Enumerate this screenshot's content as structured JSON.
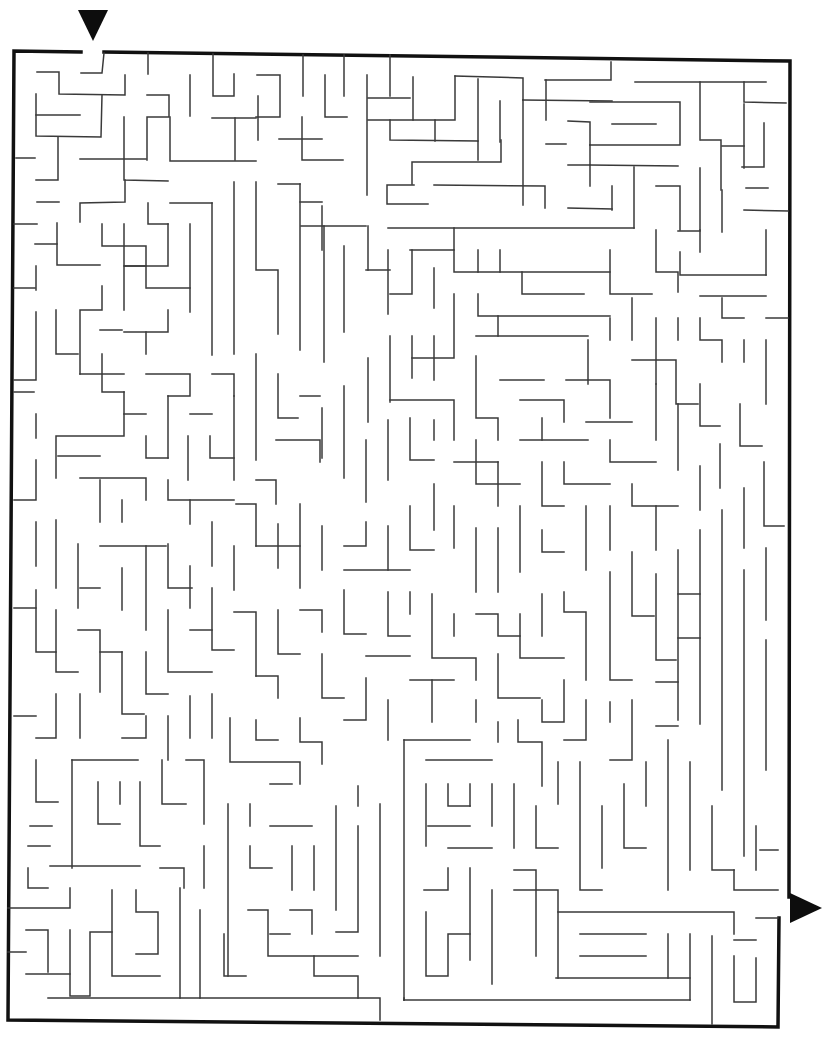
{
  "puzzle": {
    "type": "maze",
    "title": "",
    "entry": {
      "icon": "down-triangle-arrow",
      "position": "top",
      "gap_x": [
        81,
        104
      ]
    },
    "exit": {
      "icon": "right-triangle-arrow",
      "position": "right",
      "gap_y": [
        897,
        918
      ]
    },
    "colors": {
      "background": "#ffffff",
      "frame": "#111111",
      "walls": "#3a3a3a",
      "arrows": "#0d0d0d"
    },
    "grid_cell_px": 22
  }
}
